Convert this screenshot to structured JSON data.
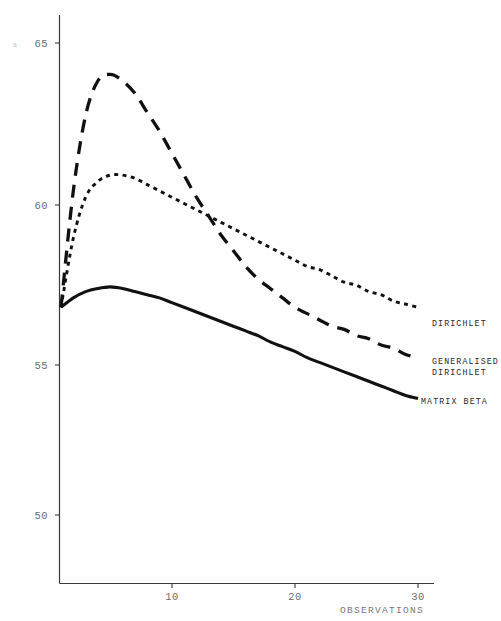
{
  "chart_data": {
    "type": "line",
    "title": "",
    "subtitle": "",
    "xlabel": "OBSERVATIONS",
    "ylabel": "a",
    "xlim": [
      1,
      30
    ],
    "ylim": [
      48.7,
      65.7
    ],
    "grid": false,
    "legend_position": "right-inline",
    "x_ticks": [
      10,
      20,
      30
    ],
    "x_tick_labels": [
      "10",
      "20",
      "30"
    ],
    "y_ticks": [
      50,
      55,
      60,
      65
    ],
    "y_tick_labels": [
      "50",
      "55",
      "60",
      "65"
    ],
    "x": [
      1,
      2,
      3,
      4,
      5,
      6,
      7,
      8,
      9,
      10,
      11,
      12,
      13,
      14,
      15,
      16,
      17,
      18,
      19,
      20,
      21,
      22,
      23,
      24,
      25,
      26,
      27,
      28,
      29,
      30
    ],
    "series": [
      {
        "name": "DIRICHLET",
        "style": "dotted",
        "color": "#111111",
        "values": [
          56.6,
          58.8,
          60.1,
          60.6,
          60.8,
          60.8,
          60.7,
          60.5,
          60.3,
          60.1,
          59.9,
          59.7,
          59.5,
          59.3,
          59.1,
          58.9,
          58.7,
          58.5,
          58.3,
          58.1,
          57.9,
          57.8,
          57.6,
          57.4,
          57.3,
          57.1,
          57.0,
          56.8,
          56.7,
          56.6
        ]
      },
      {
        "name": "GENERALISED DIRICHLET",
        "style": "dashed",
        "color": "#111111",
        "values": [
          56.6,
          60.3,
          62.7,
          63.8,
          64.0,
          63.8,
          63.4,
          62.8,
          62.2,
          61.5,
          60.8,
          60.1,
          59.5,
          58.9,
          58.4,
          57.9,
          57.5,
          57.2,
          56.9,
          56.6,
          56.4,
          56.2,
          56.0,
          55.9,
          55.7,
          55.6,
          55.4,
          55.3,
          55.1,
          55.0
        ]
      },
      {
        "name": "MATRIX BETA",
        "style": "solid",
        "color": "#111111",
        "values": [
          56.6,
          56.9,
          57.1,
          57.2,
          57.25,
          57.2,
          57.1,
          57.0,
          56.9,
          56.75,
          56.6,
          56.45,
          56.3,
          56.15,
          56.0,
          55.85,
          55.7,
          55.5,
          55.35,
          55.2,
          55.0,
          54.85,
          54.7,
          54.55,
          54.4,
          54.25,
          54.1,
          53.95,
          53.8,
          53.7
        ]
      }
    ],
    "legend_entries": [
      {
        "label": "DIRICHLET",
        "style": "dotted"
      },
      {
        "label": "GENERALISED DIRICHLET",
        "style": "dashed",
        "lines": [
          "GENERALISED",
          "DIRICHLET"
        ]
      },
      {
        "label": "MATRIX BETA",
        "style": "solid"
      }
    ]
  },
  "axes": {
    "y_title": "a",
    "x_title": "OBSERVATIONS",
    "y_tick_65": "65",
    "y_tick_60": "60",
    "y_tick_55": "55",
    "y_tick_50": "50",
    "x_tick_10": "10",
    "x_tick_20": "20",
    "x_tick_30": "30"
  },
  "legend": {
    "dirichlet": "DIRICHLET",
    "generalised_line1": "GENERALISED",
    "generalised_line2": "DIRICHLET",
    "matrix_beta": "MATRIX BETA"
  }
}
